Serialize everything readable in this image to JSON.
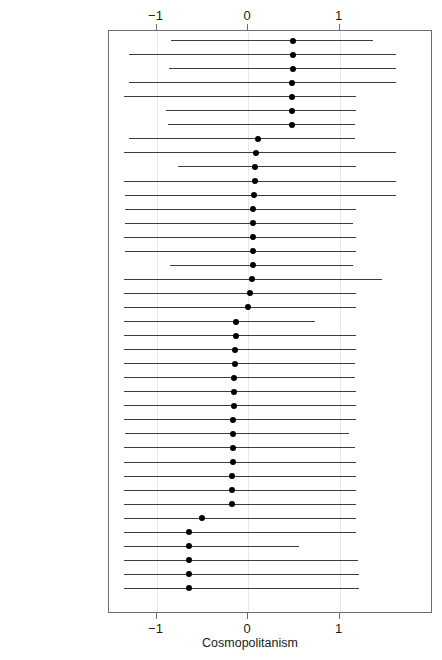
{
  "chart_data": {
    "type": "scatter",
    "title": "",
    "subtitle": "",
    "xlabel": "Cosmopolitanism",
    "ylabel": "",
    "xlim": [
      -1.52,
      2.02
    ],
    "xticks": [
      -1,
      0,
      1
    ],
    "xticklabels": [
      "−1",
      "0",
      "1"
    ],
    "grid": "vertical-at-xticks",
    "legend": "none",
    "annotations": [],
    "note": "Dot-and-whisker plot: point estimate with confidence interval per state, sorted descending by estimate.",
    "categories": [
      "Virginia",
      "Nevada",
      "California",
      "Massachusetts",
      "New Mexico",
      "Arizona",
      "Washington",
      "New Jersey",
      "Maryland",
      "Colorado",
      "Utah",
      "New Hampshire",
      "Illinois",
      "Florida",
      "New York",
      "Georgia",
      "Oregon",
      "Connecticut",
      "Texas",
      "Minnesota",
      "Kansas",
      "South Carolina",
      "Nebraska",
      "Tennessee",
      "Indiana",
      "Michigan",
      "Alabama",
      "Maine",
      "North Carolina",
      "Oklahoma",
      "Wisconsin",
      "Ohio",
      "Kentucky",
      "Pennsylvania",
      "Missouri",
      "Louisiana",
      "Arkansas",
      "Iowa",
      "West Virginia",
      "Mississippi"
    ],
    "series": [
      {
        "name": "Cosmopolitanism estimate",
        "estimates": [
          0.49,
          0.49,
          0.49,
          0.48,
          0.48,
          0.48,
          0.48,
          0.11,
          0.09,
          0.08,
          0.08,
          0.07,
          0.06,
          0.05,
          0.05,
          0.05,
          0.05,
          0.04,
          0.02,
          0.0,
          -0.13,
          -0.13,
          -0.14,
          -0.14,
          -0.15,
          -0.15,
          -0.15,
          -0.16,
          -0.16,
          -0.16,
          -0.16,
          -0.17,
          -0.17,
          -0.18,
          -0.5,
          -0.64,
          -0.65,
          -0.65,
          -0.65,
          -0.65
        ],
        "ci_low": [
          -0.84,
          -1.3,
          -0.86,
          -1.3,
          -1.35,
          -0.9,
          -0.87,
          -1.3,
          -1.36,
          -0.76,
          -1.35,
          -1.34,
          -1.34,
          -1.34,
          -1.36,
          -1.34,
          -0.85,
          -1.35,
          -1.36,
          -1.36,
          -1.36,
          -1.35,
          -1.36,
          -1.36,
          -1.36,
          -1.36,
          -1.36,
          -1.36,
          -1.34,
          -1.36,
          -1.36,
          -1.36,
          -1.36,
          -1.36,
          -1.36,
          -1.36,
          -1.36,
          -1.36,
          -1.36,
          -1.36
        ],
        "ci_high": [
          1.37,
          1.62,
          1.62,
          1.62,
          1.18,
          1.18,
          1.17,
          1.17,
          1.62,
          1.18,
          1.62,
          1.62,
          1.18,
          1.15,
          1.18,
          1.18,
          1.15,
          1.47,
          1.18,
          1.18,
          0.73,
          1.18,
          1.18,
          1.17,
          1.17,
          1.18,
          1.18,
          1.18,
          1.1,
          1.17,
          1.18,
          1.18,
          1.18,
          1.18,
          1.18,
          1.18,
          0.56,
          1.2,
          1.21,
          1.21
        ]
      }
    ]
  },
  "axis": {
    "xlabel": "Cosmopolitanism",
    "ticklabels": [
      "−1",
      "0",
      "1"
    ]
  }
}
